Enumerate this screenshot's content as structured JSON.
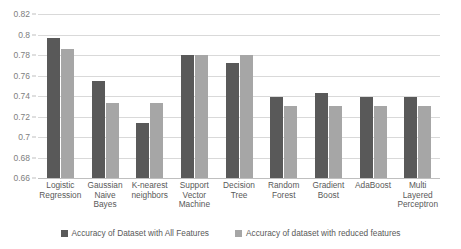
{
  "chart_data": {
    "type": "bar",
    "title": "",
    "subtitle": "",
    "xlabel": "",
    "ylabel": "",
    "ylim": [
      0.66,
      0.82
    ],
    "ytick_step": 0.02,
    "ytick_labels": [
      "0.82",
      "0.8",
      "0.78",
      "0.76",
      "0.74",
      "0.72",
      "0.7",
      "0.68",
      "0.66"
    ],
    "ytick_values": [
      0.82,
      0.8,
      0.78,
      0.76,
      0.74,
      0.72,
      0.7,
      0.68,
      0.66
    ],
    "grid": true,
    "legend_position": "bottom",
    "categories": [
      "Logistic Regression",
      "Gaussian Naive Bayes",
      "K-nearest neighbors",
      "Support Vector Machine",
      "Decision Tree",
      "Random Forest",
      "Gradient Boost",
      "AdaBoost",
      "Multi Layered Perceptron"
    ],
    "series": [
      {
        "name": "Accuracy of Dataset with All Features",
        "color": "#595959",
        "values": [
          0.797,
          0.755,
          0.714,
          0.78,
          0.772,
          0.739,
          0.743,
          0.739,
          0.739
        ]
      },
      {
        "name": "Accuracy of dataset with reduced features",
        "color": "#a6a6a6",
        "values": [
          0.786,
          0.733,
          0.733,
          0.78,
          0.78,
          0.73,
          0.73,
          0.73,
          0.73
        ]
      }
    ]
  },
  "legend": {
    "items": [
      {
        "label": "Accuracy of Dataset with All Features"
      },
      {
        "label": "Accuracy of dataset with reduced features"
      }
    ]
  }
}
